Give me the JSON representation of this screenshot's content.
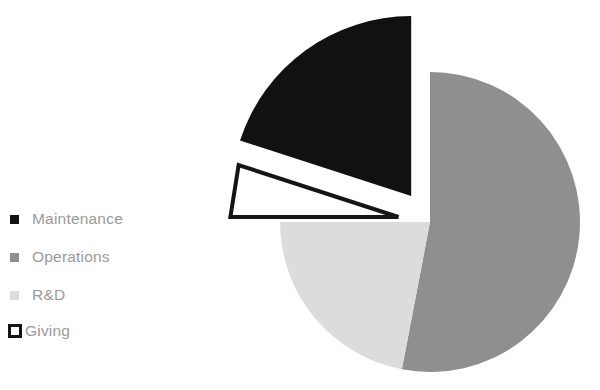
{
  "chart_data": {
    "type": "pie",
    "title": "",
    "categories": [
      "Maintenance",
      "Operations",
      "R&D",
      "Giving"
    ],
    "values": [
      20,
      53,
      22,
      5
    ],
    "colors": [
      "#111111",
      "#8f8f8f",
      "#dcdcdc",
      "#ffffff"
    ],
    "slice_borders": [
      "none",
      "none",
      "none",
      "#151515"
    ],
    "exploded": [
      true,
      false,
      false,
      true
    ],
    "legend_position": "left",
    "grid": false,
    "units": "percent",
    "slices": [
      {
        "label": "Maintenance",
        "value": 20,
        "color": "#111111",
        "exploded": true
      },
      {
        "label": "Operations",
        "value": 53,
        "color": "#8f8f8f",
        "exploded": false
      },
      {
        "label": "R&D",
        "value": 22,
        "color": "#dcdcdc",
        "exploded": false
      },
      {
        "label": "Giving",
        "value": 5,
        "color": "#ffffff",
        "exploded": true
      }
    ]
  },
  "legend": {
    "items": [
      {
        "label": "Maintenance",
        "marker": "filled-square-black"
      },
      {
        "label": "Operations",
        "marker": "filled-square-gray"
      },
      {
        "label": "R&D",
        "marker": "filled-square-lightgray"
      },
      {
        "label": "Giving",
        "marker": "outlined-square-white"
      }
    ]
  }
}
